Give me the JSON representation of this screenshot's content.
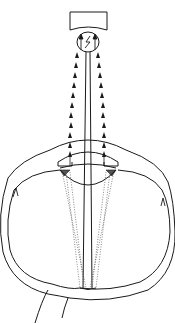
{
  "diagram": {
    "colors": {
      "background": "#ffffff",
      "stroke": "#1a1a1a",
      "dotted_ray": "#555555"
    },
    "components": [
      {
        "id": "instrument-head",
        "label": "Instrument head"
      },
      {
        "id": "instrument-lens",
        "label": "Lens with light source"
      },
      {
        "id": "light-rays",
        "label": "Light rays (arrows)"
      },
      {
        "id": "cornea",
        "label": "Cornea"
      },
      {
        "id": "iris",
        "label": "Iris"
      },
      {
        "id": "crystalline-lens",
        "label": "Crystalline lens"
      },
      {
        "id": "eyeball-wall",
        "label": "Eyeball wall (sclera)"
      },
      {
        "id": "retina-focus",
        "label": "Retinal focus point"
      },
      {
        "id": "optic-nerve",
        "label": "Optic nerve"
      }
    ]
  }
}
